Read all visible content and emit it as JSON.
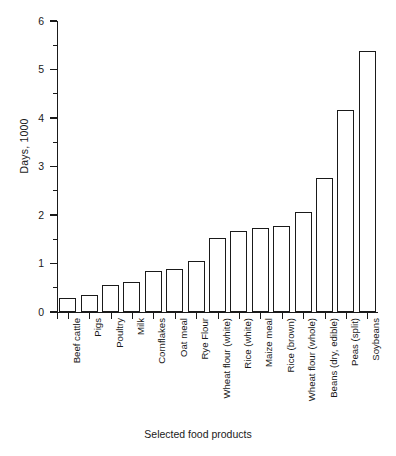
{
  "chart_data": {
    "type": "bar",
    "title": "",
    "subtitle": "",
    "xlabel": "Selected food products",
    "ylabel": "Days, 1000",
    "ylim": [
      0,
      6
    ],
    "y_ticks_major": [
      0,
      1,
      2,
      3,
      4,
      5,
      6
    ],
    "y_ticks_minor": [
      0.5,
      1.5,
      2.5,
      3.5,
      4.5,
      5.5
    ],
    "grid": false,
    "legend": "none",
    "bar_style": {
      "fill": "#ffffff",
      "edge": "#1a1a1a"
    },
    "categories": [
      "Beef cattle",
      "Pigs",
      "Poultry",
      "Milk",
      "Cornflakes",
      "Oat meal",
      "Rye Flour",
      "Wheat flour (white)",
      "Rice (white)",
      "Maize meal",
      "Rice (brown)",
      "Wheat flour (whole)",
      "Beans (dry, edible)",
      "Peas (split)",
      "Soybeans"
    ],
    "values": [
      0.29,
      0.35,
      0.56,
      0.62,
      0.84,
      0.89,
      1.06,
      1.53,
      1.66,
      1.73,
      1.78,
      2.07,
      2.77,
      4.16,
      5.38
    ]
  },
  "axis": {
    "y_tick_labels": [
      "0",
      "1",
      "2",
      "3",
      "4",
      "5",
      "6"
    ],
    "y_title": "Days, 1000",
    "x_title": "Selected food products"
  }
}
